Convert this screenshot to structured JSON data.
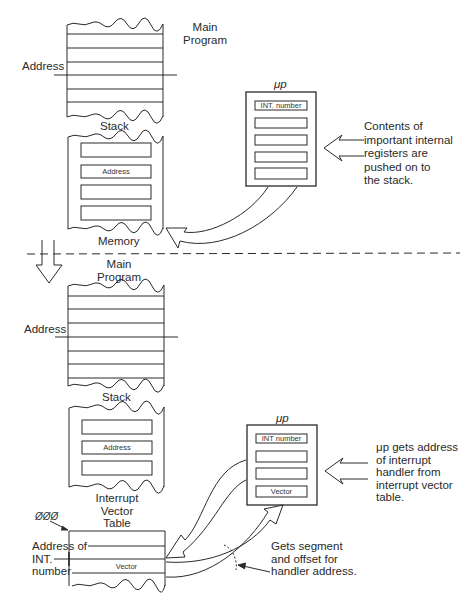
{
  "diagram": {
    "top_section": {
      "main_program_label": "Main Program",
      "main_program_line1": "Main",
      "main_program_line2": "Program",
      "address_label": "Address",
      "stack_label": "Stack",
      "stack_slots": [
        "",
        "Address",
        "",
        ""
      ],
      "memory_label": "Memory",
      "mp_label": "μp",
      "mp_registers": [
        "INT. number",
        "",
        "",
        "",
        ""
      ],
      "note": [
        "Contents of",
        "important internal",
        "registers are",
        "pushed on to",
        "the stack."
      ]
    },
    "bottom_section": {
      "main_program_line1": "Main",
      "main_program_line2": "Program",
      "address_label": "Address",
      "stack_label": "Stack",
      "stack_slots": [
        "",
        "Address",
        "",
        ""
      ],
      "ivt_label_lines": [
        "Interrupt",
        "Vector",
        "Table"
      ],
      "ivt_origin_label": "ØØØ",
      "ivt_address_label_lines": [
        "Address of",
        "INT.",
        "number"
      ],
      "ivt_vector_label": "Vector",
      "mp_label": "μp",
      "mp_registers": [
        "INT number",
        "",
        "",
        "Vector"
      ],
      "note": [
        "μp gets address",
        "of interrupt",
        "handler from",
        "interrupt vector",
        "table."
      ],
      "segment_note": [
        "Gets segment",
        "and offset for",
        "handler address."
      ]
    },
    "colors": {
      "line": "#2a2a2a",
      "background": "#ffffff"
    }
  }
}
